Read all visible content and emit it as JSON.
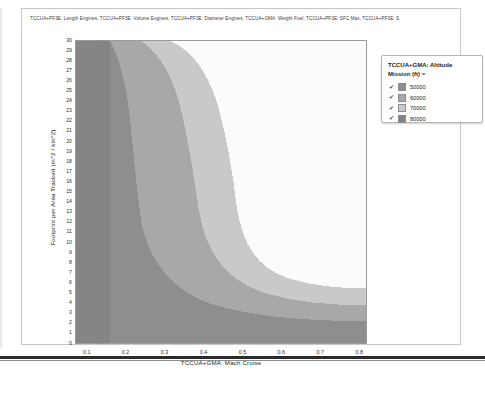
{
  "chart_title": "TCCUA+PF3E: Length Engines, TCCUA+PF3E: Volume Engines, TCCUA+PF3E: Diameter Engines, TCCUA+GMA: Weight Fuel, TCCUA+PF3E: SFC Max, TCCUA+PF3E: S",
  "legend": {
    "title_line1": "TCCUA+GMA: Altitude",
    "title_line2": "Mission (ft) =",
    "check_glyph": "✔",
    "entries": [
      {
        "label": "50000",
        "color": "#8e8e8e",
        "checked": true
      },
      {
        "label": "60000",
        "color": "#a8a8a8",
        "checked": true
      },
      {
        "label": "70000",
        "color": "#c9c9c9",
        "checked": true
      },
      {
        "label": "80000",
        "color": "#838383",
        "checked": true
      }
    ]
  },
  "chart_data": {
    "type": "heatmap",
    "title": "TCCUA+PF3E: Length Engines, TCCUA+PF3E: Volume Engines, TCCUA+PF3E: Diameter Engines, TCCUA+GMA: Weight Fuel, TCCUA+PF3E: SFC Max, TCCUA+PF3E: S",
    "xlabel": "TCCUA+GMA: Mach Cruise",
    "ylabel": "Footprint per Area Tracked (m^2 / km^2)",
    "xlim": [
      0.07,
      0.82
    ],
    "ylim": [
      0,
      30.5
    ],
    "grid": false,
    "legend_position": "right-outside",
    "legend_title": "TCCUA+GMA: Altitude Mission (ft) =",
    "x_ticks": [
      0.1,
      0.2,
      0.3,
      0.4,
      0.5,
      0.6,
      0.7,
      0.8
    ],
    "y_ticks": [
      0,
      1,
      2,
      3,
      4,
      5,
      6,
      7,
      8,
      9,
      10,
      11,
      12,
      13,
      14,
      15,
      16,
      17,
      18,
      19,
      20,
      21,
      22,
      23,
      24,
      25,
      26,
      27,
      28,
      29,
      30
    ],
    "levels": [
      {
        "value": 50000,
        "color": "#8e8e8e"
      },
      {
        "value": 60000,
        "color": "#a8a8a8"
      },
      {
        "value": 70000,
        "color": "#c9c9c9"
      },
      {
        "value": 80000,
        "color": "#f7f7f7"
      }
    ],
    "region_boundaries": {
      "band_50000_left_edge_x": 0.2,
      "band_50000_bottom_y": 6,
      "band_60000_left_edge_x": 0.24,
      "band_70000_contour_min_y": 17,
      "band_80000_white_region_min_y": 19
    }
  },
  "axes": {
    "x_label": "TCCUA+GMA: Mach Cruise",
    "y_label": "Footprint per Area Tracked (m^2 / km^2)",
    "x_tick_labels": [
      "0.1",
      "0.2",
      "0.3",
      "0.4",
      "0.5",
      "0.6",
      "0.7",
      "0.8"
    ],
    "y_tick_labels": [
      "30",
      "29",
      "28",
      "27",
      "26",
      "25",
      "24",
      "23",
      "22",
      "21",
      "20",
      "19",
      "18",
      "17",
      "16",
      "15",
      "14",
      "13",
      "12",
      "11",
      "10",
      "9",
      "8",
      "7",
      "6",
      "5",
      "4",
      "3",
      "2",
      "1",
      "0"
    ]
  }
}
